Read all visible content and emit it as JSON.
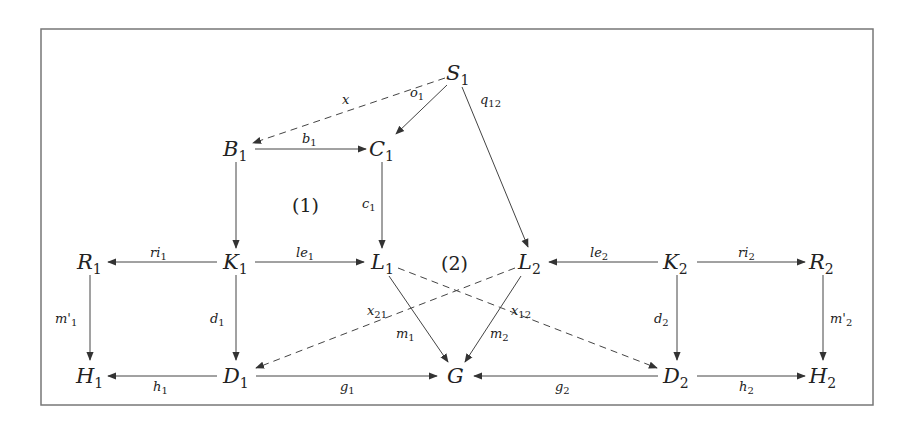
{
  "diagram": {
    "type": "commutative-diagram",
    "nodes": {
      "S1": {
        "base": "S",
        "sub": "1",
        "x": 458,
        "y": 73
      },
      "B1": {
        "base": "B",
        "sub": "1",
        "x": 237,
        "y": 149
      },
      "C1": {
        "base": "C",
        "sub": "1",
        "x": 383,
        "y": 149
      },
      "R1": {
        "base": "R",
        "sub": "1",
        "x": 90,
        "y": 262
      },
      "K1": {
        "base": "K",
        "sub": "1",
        "x": 237,
        "y": 262
      },
      "L1": {
        "base": "L",
        "sub": "1",
        "x": 383,
        "y": 262
      },
      "L2": {
        "base": "L",
        "sub": "2",
        "x": 530,
        "y": 262
      },
      "K2": {
        "base": "K",
        "sub": "2",
        "x": 677,
        "y": 262
      },
      "R2": {
        "base": "R",
        "sub": "2",
        "x": 823,
        "y": 262
      },
      "H1": {
        "base": "H",
        "sub": "1",
        "x": 90,
        "y": 376
      },
      "D1": {
        "base": "D",
        "sub": "1",
        "x": 237,
        "y": 376
      },
      "G": {
        "base": "G",
        "sub": "",
        "x": 455,
        "y": 376
      },
      "D2": {
        "base": "D",
        "sub": "2",
        "x": 677,
        "y": 376
      },
      "H2": {
        "base": "H",
        "sub": "2",
        "x": 823,
        "y": 376
      }
    },
    "edges": [
      {
        "from": "S1",
        "to": "B1",
        "label_base": "x",
        "label_sub": "",
        "style": "dashed"
      },
      {
        "from": "S1",
        "to": "C1",
        "label_base": "o",
        "label_sub": "1",
        "style": "solid"
      },
      {
        "from": "S1",
        "to": "L2",
        "label_base": "q",
        "label_sub": "12",
        "style": "solid"
      },
      {
        "from": "B1",
        "to": "C1",
        "label_base": "b",
        "label_sub": "1",
        "style": "solid"
      },
      {
        "from": "B1",
        "to": "K1",
        "label_base": "",
        "label_sub": "",
        "style": "solid"
      },
      {
        "from": "C1",
        "to": "L1",
        "label_base": "c",
        "label_sub": "1",
        "style": "solid"
      },
      {
        "from": "K1",
        "to": "R1",
        "label_base": "ri",
        "label_sub": "1",
        "style": "solid"
      },
      {
        "from": "K1",
        "to": "L1",
        "label_base": "le",
        "label_sub": "1",
        "style": "solid"
      },
      {
        "from": "K2",
        "to": "L2",
        "label_base": "le",
        "label_sub": "2",
        "style": "solid"
      },
      {
        "from": "K2",
        "to": "R2",
        "label_base": "ri",
        "label_sub": "2",
        "style": "solid"
      },
      {
        "from": "R1",
        "to": "H1",
        "label_base": "m'",
        "label_sub": "1",
        "style": "solid"
      },
      {
        "from": "K1",
        "to": "D1",
        "label_base": "d",
        "label_sub": "1",
        "style": "solid"
      },
      {
        "from": "K2",
        "to": "D2",
        "label_base": "d",
        "label_sub": "2",
        "style": "solid"
      },
      {
        "from": "R2",
        "to": "H2",
        "label_base": "m'",
        "label_sub": "2",
        "style": "solid"
      },
      {
        "from": "L1",
        "to": "G",
        "label_base": "m",
        "label_sub": "1",
        "style": "solid"
      },
      {
        "from": "L2",
        "to": "G",
        "label_base": "m",
        "label_sub": "2",
        "style": "solid"
      },
      {
        "from": "L2",
        "to": "D1",
        "label_base": "x",
        "label_sub": "21",
        "style": "dashed"
      },
      {
        "from": "L1",
        "to": "D2",
        "label_base": "x",
        "label_sub": "12",
        "style": "dashed"
      },
      {
        "from": "D1",
        "to": "H1",
        "label_base": "h",
        "label_sub": "1",
        "style": "solid"
      },
      {
        "from": "D1",
        "to": "G",
        "label_base": "g",
        "label_sub": "1",
        "style": "solid"
      },
      {
        "from": "D2",
        "to": "G",
        "label_base": "g",
        "label_sub": "2",
        "style": "solid"
      },
      {
        "from": "D2",
        "to": "H2",
        "label_base": "h",
        "label_sub": "2",
        "style": "solid"
      }
    ],
    "regions": [
      {
        "label": "(1)",
        "x": 308,
        "y": 212
      },
      {
        "label": "(2)",
        "x": 456,
        "y": 269
      }
    ],
    "labels": {
      "S1": "S",
      "S1_sub": "1",
      "B1": "B",
      "B1_sub": "1",
      "C1": "C",
      "C1_sub": "1",
      "R1": "R",
      "R1_sub": "1",
      "K1": "K",
      "K1_sub": "1",
      "L1": "L",
      "L1_sub": "1",
      "L2": "L",
      "L2_sub": "2",
      "K2": "K",
      "K2_sub": "2",
      "R2": "R",
      "R2_sub": "2",
      "H1": "H",
      "H1_sub": "1",
      "D1": "D",
      "D1_sub": "1",
      "G": "G",
      "D2": "D",
      "D2_sub": "2",
      "H2": "H",
      "H2_sub": "2",
      "x": "x",
      "o1": "o",
      "o1_sub": "1",
      "q12": "q",
      "q12_sub": "12",
      "b1": "b",
      "b1_sub": "1",
      "c1": "c",
      "c1_sub": "1",
      "ri1": "ri",
      "ri1_sub": "1",
      "le1": "le",
      "le1_sub": "1",
      "le2": "le",
      "le2_sub": "2",
      "ri2": "ri",
      "ri2_sub": "2",
      "mp1": "m'",
      "mp1_sub": "1",
      "d1": "d",
      "d1_sub": "1",
      "d2": "d",
      "d2_sub": "2",
      "mp2": "m'",
      "mp2_sub": "2",
      "m1": "m",
      "m1_sub": "1",
      "m2": "m",
      "m2_sub": "2",
      "x21": "x",
      "x21_sub": "21",
      "x12": "x",
      "x12_sub": "12",
      "h1": "h",
      "h1_sub": "1",
      "g1": "g",
      "g1_sub": "1",
      "g2": "g",
      "g2_sub": "2",
      "h2": "h",
      "h2_sub": "2",
      "region1": "(1)",
      "region2": "(2)"
    }
  }
}
